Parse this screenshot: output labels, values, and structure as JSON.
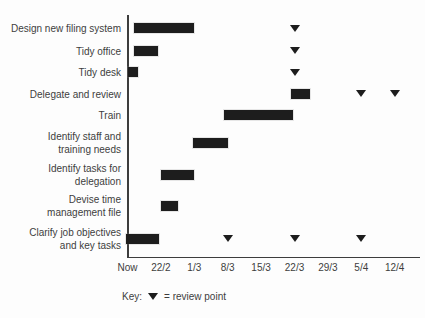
{
  "chart_data": {
    "type": "bar",
    "subtype": "gantt",
    "title": "",
    "x_axis": {
      "tick_labels": [
        "Now",
        "22/2",
        "1/3",
        "8/3",
        "15/3",
        "22/3",
        "29/3",
        "5/4",
        "12/4"
      ],
      "units": "tick index (0 = Now, one tick per week thereafter)",
      "range": [
        0,
        8
      ]
    },
    "tasks": [
      {
        "label": "Design new filing system",
        "bar_start": 0.2,
        "bar_end": 2.0,
        "reviews": [
          {
            "t": 5,
            "date": "22/3"
          }
        ]
      },
      {
        "label": "Tidy office",
        "bar_start": 0.2,
        "bar_end": 0.9,
        "reviews": [
          {
            "t": 5,
            "date": "22/3"
          }
        ]
      },
      {
        "label": "Tidy desk",
        "bar_start": 0.0,
        "bar_end": 0.3,
        "reviews": [
          {
            "t": 5,
            "date": "22/3"
          }
        ]
      },
      {
        "label": "Delegate and review",
        "bar_start": 4.9,
        "bar_end": 5.45,
        "reviews": [
          {
            "t": 7,
            "date": "5/4"
          },
          {
            "t": 8,
            "date": "12/4"
          }
        ]
      },
      {
        "label": "Train",
        "bar_start": 2.9,
        "bar_end": 4.95,
        "reviews": []
      },
      {
        "label": "Identify staff and\ntraining needs",
        "bar_start": 1.95,
        "bar_end": 3.0,
        "reviews": []
      },
      {
        "label": "Identify tasks for\ndelegation",
        "bar_start": 1.0,
        "bar_end": 2.0,
        "reviews": []
      },
      {
        "label": "Devise time\nmanagement file",
        "bar_start": 1.0,
        "bar_end": 1.5,
        "reviews": []
      },
      {
        "label": "Clarify job objectives\nand key tasks",
        "bar_start": -0.05,
        "bar_end": 0.95,
        "reviews": [
          {
            "t": 3,
            "date": "8/3"
          },
          {
            "t": 5,
            "date": "22/3"
          },
          {
            "t": 7,
            "date": "5/4"
          }
        ]
      }
    ],
    "legend": {
      "prefix": "Key:",
      "symbol": "filled-down-triangle",
      "meaning": "= review point",
      "position": "bottom-center"
    },
    "colors": {
      "bar": "#1d1d1d",
      "marker": "#1d1d1d",
      "axis": "#3d3d3d",
      "text": "#3d3d3d",
      "background": "#fdfdfd"
    },
    "grid": "off"
  }
}
